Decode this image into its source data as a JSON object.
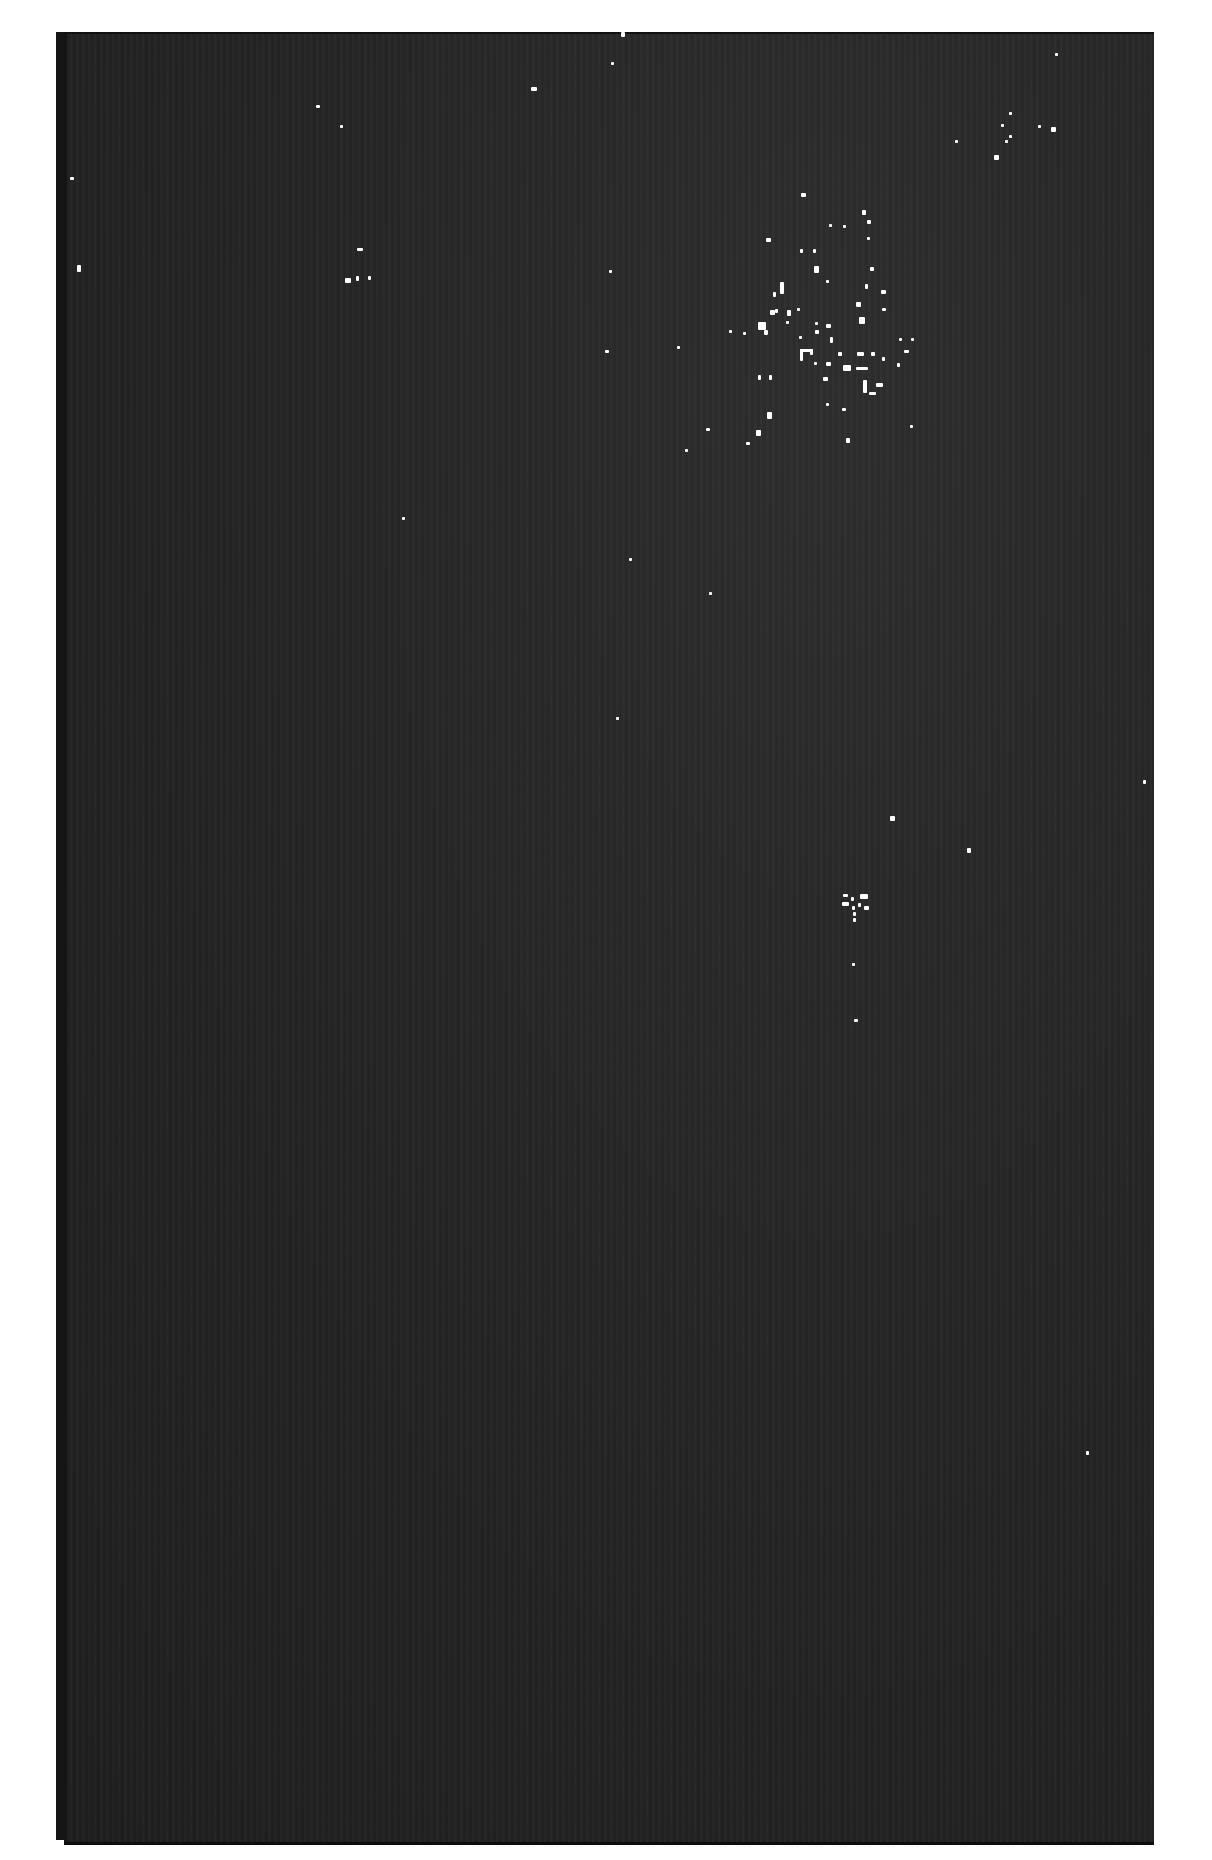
{
  "image": {
    "description": "Scanned astronomical photographic plate showing a dark star field with a sparse open star cluster in the upper right",
    "background_color": "#262626",
    "border_color": "#ffffff",
    "plate_rect": {
      "x": 64,
      "y": 32,
      "width": 1090,
      "height": 1808
    }
  },
  "stars": [
    {
      "x": 531,
      "y": 87,
      "w": 6,
      "h": 4
    },
    {
      "x": 611,
      "y": 62,
      "w": 3,
      "h": 3
    },
    {
      "x": 621,
      "y": 32,
      "w": 4,
      "h": 5
    },
    {
      "x": 345,
      "y": 278,
      "w": 6,
      "h": 5
    },
    {
      "x": 356,
      "y": 276,
      "w": 3,
      "h": 5
    },
    {
      "x": 368,
      "y": 276,
      "w": 3,
      "h": 4
    },
    {
      "x": 357,
      "y": 248,
      "w": 6,
      "h": 3
    },
    {
      "x": 316,
      "y": 105,
      "w": 4,
      "h": 3
    },
    {
      "x": 340,
      "y": 125,
      "w": 3,
      "h": 3
    },
    {
      "x": 70,
      "y": 177,
      "w": 4,
      "h": 3
    },
    {
      "x": 77,
      "y": 265,
      "w": 4,
      "h": 7
    },
    {
      "x": 1055,
      "y": 53,
      "w": 3,
      "h": 3
    },
    {
      "x": 1005,
      "y": 140,
      "w": 3,
      "h": 3
    },
    {
      "x": 1001,
      "y": 124,
      "w": 3,
      "h": 3
    },
    {
      "x": 1009,
      "y": 135,
      "w": 3,
      "h": 3
    },
    {
      "x": 1038,
      "y": 125,
      "w": 3,
      "h": 3
    },
    {
      "x": 1051,
      "y": 127,
      "w": 5,
      "h": 5
    },
    {
      "x": 994,
      "y": 155,
      "w": 5,
      "h": 5
    },
    {
      "x": 955,
      "y": 140,
      "w": 3,
      "h": 3
    },
    {
      "x": 801,
      "y": 193,
      "w": 5,
      "h": 4
    },
    {
      "x": 862,
      "y": 210,
      "w": 4,
      "h": 5
    },
    {
      "x": 867,
      "y": 220,
      "w": 4,
      "h": 4
    },
    {
      "x": 829,
      "y": 224,
      "w": 3,
      "h": 3
    },
    {
      "x": 843,
      "y": 225,
      "w": 3,
      "h": 3
    },
    {
      "x": 800,
      "y": 249,
      "w": 3,
      "h": 4
    },
    {
      "x": 813,
      "y": 249,
      "w": 3,
      "h": 4
    },
    {
      "x": 867,
      "y": 237,
      "w": 3,
      "h": 3
    },
    {
      "x": 766,
      "y": 238,
      "w": 5,
      "h": 4
    },
    {
      "x": 814,
      "y": 266,
      "w": 5,
      "h": 7
    },
    {
      "x": 870,
      "y": 267,
      "w": 4,
      "h": 4
    },
    {
      "x": 780,
      "y": 282,
      "w": 4,
      "h": 12
    },
    {
      "x": 773,
      "y": 292,
      "w": 3,
      "h": 5
    },
    {
      "x": 826,
      "y": 280,
      "w": 3,
      "h": 3
    },
    {
      "x": 865,
      "y": 284,
      "w": 3,
      "h": 5
    },
    {
      "x": 881,
      "y": 290,
      "w": 5,
      "h": 4
    },
    {
      "x": 856,
      "y": 302,
      "w": 5,
      "h": 5
    },
    {
      "x": 882,
      "y": 308,
      "w": 4,
      "h": 3
    },
    {
      "x": 770,
      "y": 310,
      "w": 5,
      "h": 5
    },
    {
      "x": 775,
      "y": 309,
      "w": 3,
      "h": 4
    },
    {
      "x": 787,
      "y": 310,
      "w": 4,
      "h": 6
    },
    {
      "x": 797,
      "y": 308,
      "w": 3,
      "h": 3
    },
    {
      "x": 758,
      "y": 322,
      "w": 8,
      "h": 8
    },
    {
      "x": 764,
      "y": 330,
      "w": 4,
      "h": 5
    },
    {
      "x": 786,
      "y": 321,
      "w": 3,
      "h": 3
    },
    {
      "x": 815,
      "y": 322,
      "w": 3,
      "h": 3
    },
    {
      "x": 826,
      "y": 324,
      "w": 5,
      "h": 4
    },
    {
      "x": 815,
      "y": 330,
      "w": 4,
      "h": 4
    },
    {
      "x": 859,
      "y": 317,
      "w": 6,
      "h": 7
    },
    {
      "x": 799,
      "y": 336,
      "w": 3,
      "h": 3
    },
    {
      "x": 830,
      "y": 337,
      "w": 3,
      "h": 6
    },
    {
      "x": 729,
      "y": 330,
      "w": 3,
      "h": 3
    },
    {
      "x": 743,
      "y": 332,
      "w": 3,
      "h": 3
    },
    {
      "x": 899,
      "y": 338,
      "w": 3,
      "h": 3
    },
    {
      "x": 911,
      "y": 338,
      "w": 3,
      "h": 3
    },
    {
      "x": 904,
      "y": 350,
      "w": 5,
      "h": 3
    },
    {
      "x": 800,
      "y": 349,
      "w": 3,
      "h": 12
    },
    {
      "x": 800,
      "y": 349,
      "w": 13,
      "h": 3
    },
    {
      "x": 810,
      "y": 349,
      "w": 3,
      "h": 6
    },
    {
      "x": 838,
      "y": 352,
      "w": 4,
      "h": 4
    },
    {
      "x": 857,
      "y": 352,
      "w": 7,
      "h": 4
    },
    {
      "x": 871,
      "y": 352,
      "w": 4,
      "h": 4
    },
    {
      "x": 882,
      "y": 357,
      "w": 3,
      "h": 4
    },
    {
      "x": 897,
      "y": 363,
      "w": 3,
      "h": 4
    },
    {
      "x": 814,
      "y": 362,
      "w": 3,
      "h": 3
    },
    {
      "x": 826,
      "y": 362,
      "w": 5,
      "h": 4
    },
    {
      "x": 843,
      "y": 365,
      "w": 8,
      "h": 6
    },
    {
      "x": 856,
      "y": 367,
      "w": 12,
      "h": 3
    },
    {
      "x": 758,
      "y": 375,
      "w": 3,
      "h": 5
    },
    {
      "x": 769,
      "y": 375,
      "w": 3,
      "h": 5
    },
    {
      "x": 823,
      "y": 377,
      "w": 5,
      "h": 4
    },
    {
      "x": 863,
      "y": 380,
      "w": 4,
      "h": 13
    },
    {
      "x": 876,
      "y": 383,
      "w": 7,
      "h": 4
    },
    {
      "x": 869,
      "y": 392,
      "w": 7,
      "h": 3
    },
    {
      "x": 826,
      "y": 403,
      "w": 3,
      "h": 3
    },
    {
      "x": 842,
      "y": 408,
      "w": 4,
      "h": 3
    },
    {
      "x": 767,
      "y": 412,
      "w": 5,
      "h": 7
    },
    {
      "x": 756,
      "y": 430,
      "w": 5,
      "h": 6
    },
    {
      "x": 746,
      "y": 442,
      "w": 4,
      "h": 3
    },
    {
      "x": 910,
      "y": 425,
      "w": 3,
      "h": 3
    },
    {
      "x": 846,
      "y": 438,
      "w": 4,
      "h": 5
    },
    {
      "x": 685,
      "y": 449,
      "w": 3,
      "h": 3
    },
    {
      "x": 706,
      "y": 428,
      "w": 4,
      "h": 3
    },
    {
      "x": 605,
      "y": 350,
      "w": 4,
      "h": 3
    },
    {
      "x": 609,
      "y": 270,
      "w": 3,
      "h": 3
    },
    {
      "x": 677,
      "y": 346,
      "w": 3,
      "h": 3
    },
    {
      "x": 1009,
      "y": 112,
      "w": 3,
      "h": 3
    },
    {
      "x": 402,
      "y": 517,
      "w": 3,
      "h": 3
    },
    {
      "x": 629,
      "y": 558,
      "w": 3,
      "h": 3
    },
    {
      "x": 709,
      "y": 592,
      "w": 3,
      "h": 3
    },
    {
      "x": 616,
      "y": 717,
      "w": 3,
      "h": 3
    },
    {
      "x": 890,
      "y": 816,
      "w": 5,
      "h": 5
    },
    {
      "x": 967,
      "y": 848,
      "w": 4,
      "h": 5
    },
    {
      "x": 843,
      "y": 894,
      "w": 5,
      "h": 3
    },
    {
      "x": 860,
      "y": 894,
      "w": 8,
      "h": 5
    },
    {
      "x": 842,
      "y": 902,
      "w": 7,
      "h": 4
    },
    {
      "x": 851,
      "y": 897,
      "w": 3,
      "h": 4
    },
    {
      "x": 852,
      "y": 906,
      "w": 3,
      "h": 4
    },
    {
      "x": 858,
      "y": 903,
      "w": 3,
      "h": 4
    },
    {
      "x": 864,
      "y": 906,
      "w": 5,
      "h": 4
    },
    {
      "x": 853,
      "y": 912,
      "w": 3,
      "h": 4
    },
    {
      "x": 853,
      "y": 918,
      "w": 3,
      "h": 4
    },
    {
      "x": 852,
      "y": 963,
      "w": 3,
      "h": 3
    },
    {
      "x": 854,
      "y": 1019,
      "w": 4,
      "h": 3
    },
    {
      "x": 1086,
      "y": 1451,
      "w": 3,
      "h": 4
    },
    {
      "x": 1143,
      "y": 780,
      "w": 3,
      "h": 4
    }
  ]
}
